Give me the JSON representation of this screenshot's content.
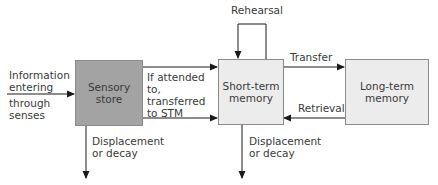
{
  "diagram": {
    "colors": {
      "sensory_fill": "#a3a3a3",
      "memory_fill": "#ececec",
      "line": "#1a1a1a",
      "border": "#8a8a8a",
      "text": "#3a3a3a"
    },
    "nodes": {
      "sensory": {
        "label": "Sensory\nstore"
      },
      "stm": {
        "label": "Short-term\nmemory"
      },
      "ltm": {
        "label": "Long-term\nmemory"
      }
    },
    "edges": {
      "input": {
        "label_top": "Information\nentering",
        "label_bottom": "through\nsenses"
      },
      "attended": {
        "label": "If attended\nto,\ntransferred\nto STM"
      },
      "rehearsal": {
        "label": "Rehearsal"
      },
      "transfer": {
        "label": "Transfer"
      },
      "retrieval": {
        "label": "Retrieval"
      },
      "sensory_decay": {
        "label": "Displacement\nor decay"
      },
      "stm_decay": {
        "label": "Displacement\nor decay"
      }
    }
  }
}
